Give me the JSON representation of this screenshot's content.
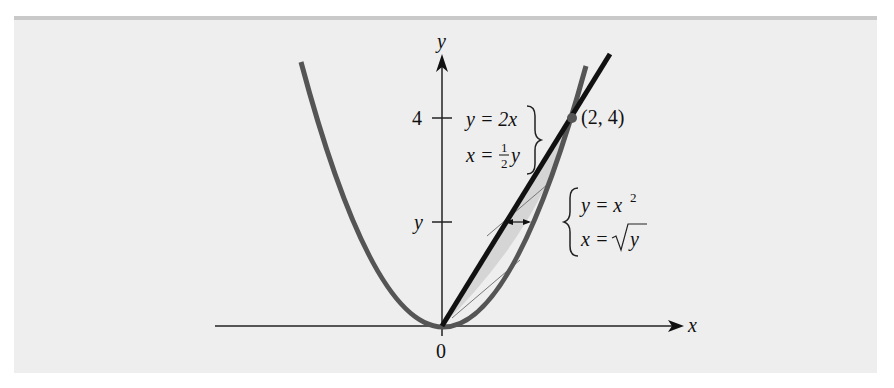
{
  "figure": {
    "type": "diagram",
    "axes": {
      "x_label": "x",
      "y_label": "y",
      "origin_label": "0",
      "y_ticks": [
        {
          "label": "4"
        },
        {
          "label": "y"
        }
      ]
    },
    "curves": {
      "line": {
        "eq1": "y = 2x",
        "eq2_lhs": "x = ",
        "eq2_frac_num": "1",
        "eq2_frac_den": "2",
        "eq2_var": "y"
      },
      "parabola": {
        "eq1_base": "y = x",
        "eq1_exp": "2",
        "eq2_lhs": "x = ",
        "eq2_var": "y"
      }
    },
    "intersection_label": "(2, 4)",
    "colors": {
      "panel": "#eeeeee",
      "panel_border": "#c9c9c9",
      "line": "#111111",
      "parabola": "#555555",
      "shade": "#d2d2d2"
    }
  }
}
